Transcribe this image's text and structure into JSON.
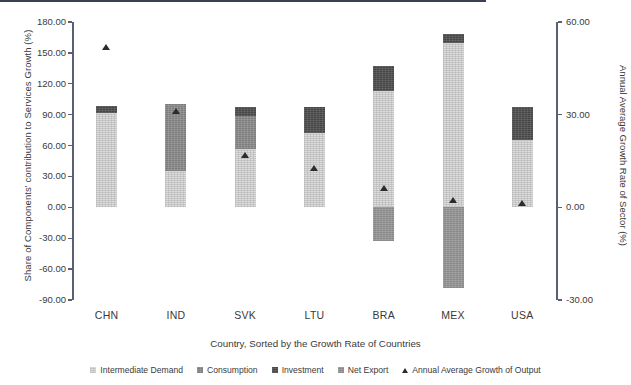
{
  "chart_data": {
    "type": "bar",
    "title": "",
    "subtitle": "",
    "xlabel": "Country, Sorted by the Growth Rate of Countries",
    "ylabel": "Share of Components' contribution to Services Growth (%)",
    "ylabel_secondary": "Annual Average Growth Rate of Sector (%)",
    "categories": [
      "CHN",
      "IND",
      "SVK",
      "LTU",
      "BRA",
      "MEX",
      "USA"
    ],
    "ylim": [
      -90,
      180
    ],
    "yticks": [
      -90,
      -60,
      -30,
      0,
      30,
      60,
      90,
      120,
      150,
      180
    ],
    "ytick_labels": [
      "-90.00",
      "-60.00",
      "-30.00",
      "0.00",
      "30.00",
      "60.00",
      "90.00",
      "120.00",
      "150.00",
      "180.00"
    ],
    "ylim_secondary": [
      -30,
      60
    ],
    "yticks_secondary": [
      -30,
      0,
      30,
      60
    ],
    "ytick_labels_secondary": [
      "-30.00",
      "0.00",
      "30.00",
      "60.00"
    ],
    "grid": false,
    "stacked": true,
    "legend_position": "bottom",
    "series": [
      {
        "name": "Intermediate Demand",
        "color": "#dcdcdc",
        "values": [
          92,
          35,
          57,
          72,
          113,
          160,
          65
        ]
      },
      {
        "name": "Consumption",
        "color": "#8e8e8e",
        "values": [
          0,
          65,
          32,
          0,
          0,
          0,
          0
        ]
      },
      {
        "name": "Investment",
        "color": "#474747",
        "values": [
          6,
          0,
          8,
          25,
          24,
          8,
          32
        ]
      },
      {
        "name": "Net Export",
        "color": "#9a9a9a",
        "values": [
          0,
          0,
          0,
          0,
          -33,
          -78,
          0
        ]
      }
    ],
    "marker_series": {
      "name": "Annual Average Growth of Output",
      "axis": "secondary",
      "marker": "triangle",
      "color": "#2c2c2c",
      "values_secondary": [
        51.7,
        31.0,
        16.7,
        12.7,
        6.3,
        2.3,
        1.3
      ],
      "values_primary_scale": [
        155,
        93,
        50,
        38,
        19,
        7,
        4
      ]
    }
  },
  "legend": {
    "items": [
      {
        "label": "Intermediate Demand",
        "marker": "square-swatch-intermediate"
      },
      {
        "label": "Consumption",
        "marker": "square-swatch-consumption"
      },
      {
        "label": "Investment",
        "marker": "square-swatch-investment"
      },
      {
        "label": "Net Export",
        "marker": "square-swatch-netexport"
      },
      {
        "label": "Annual Average Growth of Output",
        "marker": "triangle-marker"
      }
    ]
  }
}
